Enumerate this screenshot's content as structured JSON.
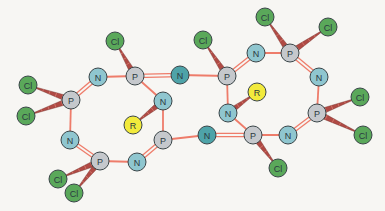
{
  "diagram": {
    "title": "",
    "colors": {
      "background": "#f7f6f3",
      "bond": "#ee7c6a",
      "wedge": "#b04a44",
      "atom_P": "#c5c8cc",
      "atom_N": "#8fc6cf",
      "atom_N_bridge": "#4ea3a8",
      "atom_Cl": "#5aa85a",
      "atom_R": "#f2ea3c",
      "outline": "#3a4548"
    },
    "atoms": [
      {
        "id": "P1",
        "label": "P",
        "type": "P",
        "x": 71,
        "y": 100
      },
      {
        "id": "Cl1",
        "label": "Cl",
        "type": "Cl",
        "x": 28,
        "y": 85
      },
      {
        "id": "Cl2",
        "label": "Cl",
        "type": "Cl",
        "x": 26,
        "y": 116
      },
      {
        "id": "N1",
        "label": "N",
        "type": "N",
        "x": 98,
        "y": 77
      },
      {
        "id": "P2",
        "label": "P",
        "type": "P",
        "x": 135,
        "y": 76
      },
      {
        "id": "Cl3",
        "label": "Cl",
        "type": "Cl",
        "x": 115,
        "y": 41
      },
      {
        "id": "N2",
        "label": "N",
        "type": "N_bridge",
        "x": 180,
        "y": 75
      },
      {
        "id": "N3",
        "label": "N",
        "type": "N",
        "x": 163,
        "y": 101
      },
      {
        "id": "R1",
        "label": "R",
        "type": "R",
        "x": 133,
        "y": 125
      },
      {
        "id": "P3",
        "label": "P",
        "type": "P",
        "x": 163,
        "y": 140
      },
      {
        "id": "N4",
        "label": "N",
        "type": "N",
        "x": 70,
        "y": 140
      },
      {
        "id": "P4",
        "label": "P",
        "type": "P",
        "x": 100,
        "y": 161
      },
      {
        "id": "Cl4",
        "label": "Cl",
        "type": "Cl",
        "x": 58,
        "y": 179
      },
      {
        "id": "Cl5",
        "label": "Cl",
        "type": "Cl",
        "x": 74,
        "y": 193
      },
      {
        "id": "N5",
        "label": "N",
        "type": "N",
        "x": 137,
        "y": 162
      },
      {
        "id": "P5",
        "label": "P",
        "type": "P",
        "x": 227,
        "y": 76
      },
      {
        "id": "Cl6",
        "label": "Cl",
        "type": "Cl",
        "x": 203,
        "y": 40
      },
      {
        "id": "N6",
        "label": "N",
        "type": "N",
        "x": 256,
        "y": 53
      },
      {
        "id": "P6",
        "label": "P",
        "type": "P",
        "x": 290,
        "y": 53
      },
      {
        "id": "Cl7",
        "label": "Cl",
        "type": "Cl",
        "x": 265,
        "y": 17
      },
      {
        "id": "Cl8",
        "label": "Cl",
        "type": "Cl",
        "x": 328,
        "y": 27
      },
      {
        "id": "N7",
        "label": "N",
        "type": "N",
        "x": 319,
        "y": 77
      },
      {
        "id": "P7",
        "label": "P",
        "type": "P",
        "x": 317,
        "y": 113
      },
      {
        "id": "Cl9",
        "label": "Cl",
        "type": "Cl",
        "x": 360,
        "y": 97
      },
      {
        "id": "Cl10",
        "label": "Cl",
        "type": "Cl",
        "x": 363,
        "y": 135
      },
      {
        "id": "N8",
        "label": "N",
        "type": "N",
        "x": 228,
        "y": 113
      },
      {
        "id": "R2",
        "label": "R",
        "type": "R",
        "x": 257,
        "y": 92
      },
      {
        "id": "N9",
        "label": "N",
        "type": "N_bridge",
        "x": 207,
        "y": 135
      },
      {
        "id": "P8",
        "label": "P",
        "type": "P",
        "x": 253,
        "y": 135
      },
      {
        "id": "Cl11",
        "label": "Cl",
        "type": "Cl",
        "x": 278,
        "y": 168
      },
      {
        "id": "N10",
        "label": "N",
        "type": "N",
        "x": 288,
        "y": 135
      }
    ],
    "bonds": [
      {
        "a": "P1",
        "b": "N1",
        "order": 2
      },
      {
        "a": "N1",
        "b": "P2",
        "order": 1
      },
      {
        "a": "P2",
        "b": "N2",
        "order": 2
      },
      {
        "a": "P2",
        "b": "N3",
        "order": 1
      },
      {
        "a": "N3",
        "b": "P3",
        "order": 1
      },
      {
        "a": "P1",
        "b": "N4",
        "order": 1
      },
      {
        "a": "N4",
        "b": "P4",
        "order": 2
      },
      {
        "a": "P4",
        "b": "N5",
        "order": 1
      },
      {
        "a": "N5",
        "b": "P3",
        "order": 2
      },
      {
        "a": "P3",
        "b": "N9",
        "order": 1
      },
      {
        "a": "N2",
        "b": "P5",
        "order": 1
      },
      {
        "a": "P5",
        "b": "N6",
        "order": 2
      },
      {
        "a": "N6",
        "b": "P6",
        "order": 1
      },
      {
        "a": "P6",
        "b": "N7",
        "order": 2
      },
      {
        "a": "N7",
        "b": "P7",
        "order": 1
      },
      {
        "a": "P7",
        "b": "N10",
        "order": 2
      },
      {
        "a": "N10",
        "b": "P8",
        "order": 1
      },
      {
        "a": "P8",
        "b": "N9",
        "order": 2
      },
      {
        "a": "P8",
        "b": "N8",
        "order": 1
      },
      {
        "a": "N8",
        "b": "P5",
        "order": 1
      }
    ],
    "wedges": [
      {
        "from": "Cl1",
        "to": "P1"
      },
      {
        "from": "Cl2",
        "to": "P1"
      },
      {
        "from": "Cl3",
        "to": "P2"
      },
      {
        "from": "R1",
        "to": "N3"
      },
      {
        "from": "Cl4",
        "to": "P4"
      },
      {
        "from": "Cl5",
        "to": "P4"
      },
      {
        "from": "Cl6",
        "to": "P5"
      },
      {
        "from": "Cl7",
        "to": "P6"
      },
      {
        "from": "Cl8",
        "to": "P6"
      },
      {
        "from": "Cl9",
        "to": "P7"
      },
      {
        "from": "Cl10",
        "to": "P7"
      },
      {
        "from": "R2",
        "to": "N8"
      },
      {
        "from": "Cl11",
        "to": "P8"
      }
    ]
  }
}
